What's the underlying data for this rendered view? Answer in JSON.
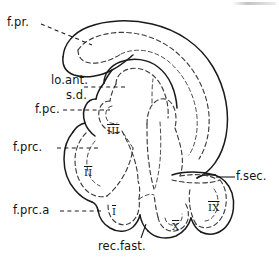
{
  "figure": {
    "kind": "anatomical-line-drawing",
    "background_color": "#ffffff",
    "outline_color": "#1a1a1a",
    "dashed_color": "#3d3d3d",
    "label_color": "#141414"
  },
  "callouts": [
    {
      "id": "f-pr",
      "label": "f.pr.",
      "leader": "dashed"
    },
    {
      "id": "lo-ant",
      "label": "lo.ant.",
      "leader": "dashed"
    },
    {
      "id": "s-d",
      "label": "s.d.",
      "leader": "none"
    },
    {
      "id": "f-pc",
      "label": "f.pc.",
      "leader": "dashed"
    },
    {
      "id": "f-prc",
      "label": "f.prc.",
      "leader": "dashed"
    },
    {
      "id": "f-prc-a",
      "label": "f.prc.a",
      "leader": "dashed"
    },
    {
      "id": "f-sec",
      "label": "f.sec.",
      "leader": "solid"
    },
    {
      "id": "rec-fast",
      "label": "rec.fast.",
      "leader": "solid"
    }
  ],
  "lobules": [
    {
      "id": "lobule-1",
      "label": "I"
    },
    {
      "id": "lobule-2",
      "label": "II"
    },
    {
      "id": "lobule-3",
      "label": "III"
    },
    {
      "id": "lobule-9",
      "label": "IX"
    },
    {
      "id": "lobule-10",
      "label": "X"
    }
  ]
}
